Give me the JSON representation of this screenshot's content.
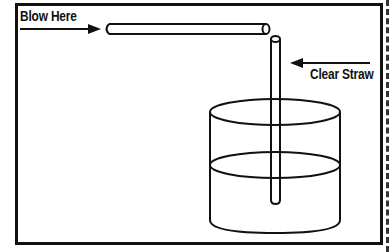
{
  "diagram": {
    "labels": {
      "blow_here": "Blow Here",
      "clear_straw": "Clear Straw"
    },
    "colors": {
      "line": "#111111",
      "background": "#ffffff"
    },
    "elements": [
      "horizontal-straw",
      "vertical-straw",
      "cup-of-water",
      "arrow-blow-here",
      "arrow-clear-straw"
    ]
  }
}
